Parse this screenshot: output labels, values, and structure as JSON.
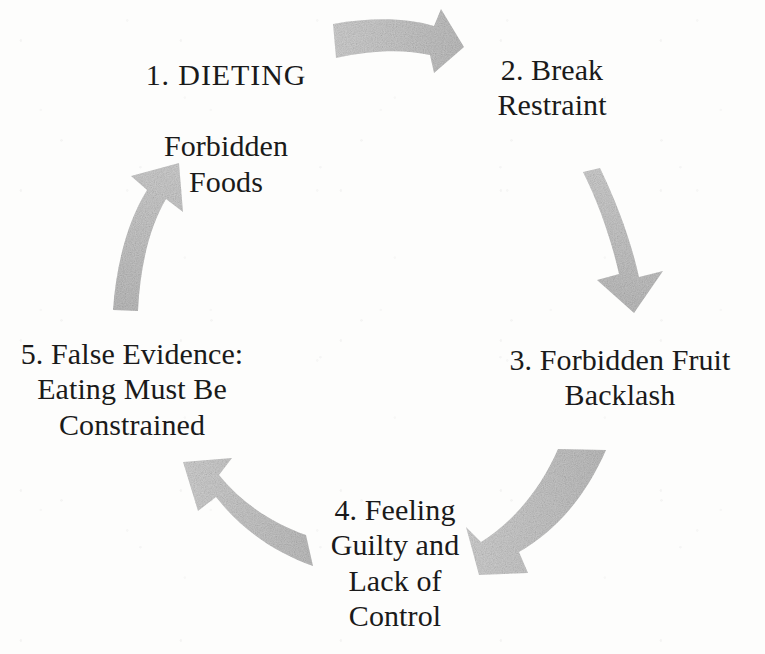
{
  "diagram": {
    "type": "cycle",
    "direction": "clockwise",
    "background_color": "#fdfdfc",
    "text_color": "#1a1a1a",
    "arrow_color": "#c6c6c6",
    "nodes": [
      {
        "id": "node-1",
        "number": "1.",
        "label": "1. DIETING\nForbidden\nFoods",
        "head": "1. DIETING",
        "body": "Forbidden\nFoods",
        "position": "top-left"
      },
      {
        "id": "node-2",
        "number": "2.",
        "label": "2. Break\nRestraint",
        "position": "top-right"
      },
      {
        "id": "node-3",
        "number": "3.",
        "label": "3. Forbidden Fruit\nBacklash",
        "position": "right"
      },
      {
        "id": "node-4",
        "number": "4.",
        "label": "4. Feeling\nGuilty and\nLack of\nControl",
        "position": "bottom"
      },
      {
        "id": "node-5",
        "number": "5.",
        "label": "5. False Evidence:\nEating Must Be\nConstrained",
        "position": "left"
      }
    ],
    "arrows": [
      {
        "id": "arrow-1-to-2",
        "from": "node-1",
        "to": "node-2",
        "icon": "curved-arrow-right-icon"
      },
      {
        "id": "arrow-2-to-3",
        "from": "node-2",
        "to": "node-3",
        "icon": "curved-arrow-down-icon"
      },
      {
        "id": "arrow-3-to-4",
        "from": "node-3",
        "to": "node-4",
        "icon": "curved-arrow-down-left-icon"
      },
      {
        "id": "arrow-4-to-5",
        "from": "node-4",
        "to": "node-5",
        "icon": "curved-arrow-up-left-icon"
      },
      {
        "id": "arrow-5-to-1",
        "from": "node-5",
        "to": "node-1",
        "icon": "curved-arrow-up-right-icon"
      }
    ]
  }
}
